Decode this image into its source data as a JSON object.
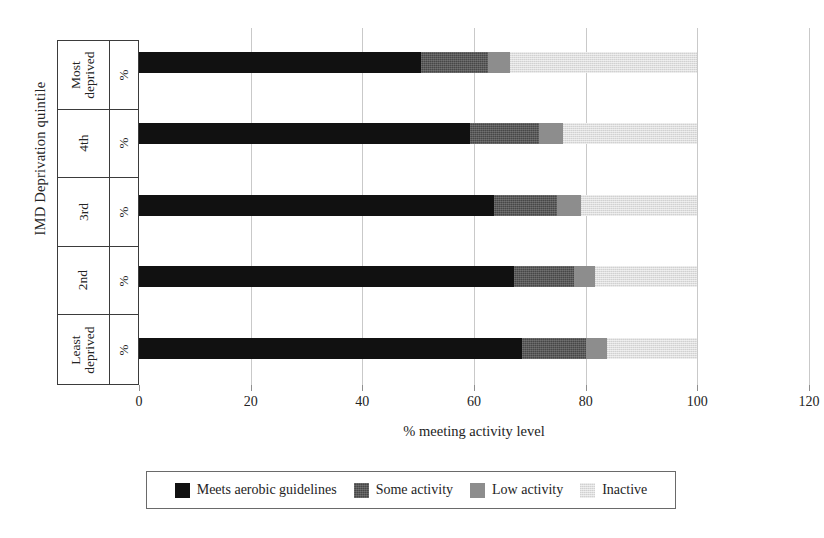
{
  "chart_data": {
    "type": "bar",
    "orientation": "horizontal",
    "stacked": true,
    "title": "",
    "xlabel": "% meeting activity level",
    "ylabel": "IMD Deprivation quintile",
    "xlim": [
      0,
      120
    ],
    "xticks": [
      0,
      20,
      40,
      60,
      80,
      100,
      120
    ],
    "xtick_labels": [
      "0",
      "20",
      "40",
      "60",
      "80",
      "100",
      "120"
    ],
    "grid": true,
    "legend_position": "bottom",
    "categories": [
      "Most deprived",
      "4th",
      "3rd",
      "2nd",
      "Least deprived"
    ],
    "category_units": [
      "%",
      "%",
      "%",
      "%",
      "%"
    ],
    "series": [
      {
        "name": "Meets aerobic guidelines",
        "color": "#111111",
        "values": [
          50.5,
          59.3,
          63.6,
          67.2,
          68.6
        ]
      },
      {
        "name": "Some activity",
        "color": "#474747",
        "values": [
          12.0,
          12.4,
          11.3,
          10.8,
          11.5
        ]
      },
      {
        "name": "Low activity",
        "color": "#8d8d8d",
        "values": [
          4.0,
          4.2,
          4.2,
          3.7,
          3.7
        ]
      },
      {
        "name": "Inactive",
        "color": "#dedede",
        "values": [
          33.5,
          24.1,
          20.9,
          18.3,
          16.2
        ]
      }
    ]
  },
  "axes": {
    "y_title": "IMD Deprivation quintile",
    "x_title": "% meeting activity level"
  },
  "rows": [
    {
      "name": "Most\ndeprived",
      "unit": "%"
    },
    {
      "name": "4th",
      "unit": "%"
    },
    {
      "name": "3rd",
      "unit": "%"
    },
    {
      "name": "2nd",
      "unit": "%"
    },
    {
      "name": "Least\ndeprived",
      "unit": "%"
    }
  ],
  "legend": {
    "items": [
      {
        "label": "Meets aerobic guidelines",
        "color": "#111111"
      },
      {
        "label": "Some activity",
        "color": "#474747"
      },
      {
        "label": "Low activity",
        "color": "#8d8d8d"
      },
      {
        "label": "Inactive",
        "color": "#dedede"
      }
    ]
  }
}
